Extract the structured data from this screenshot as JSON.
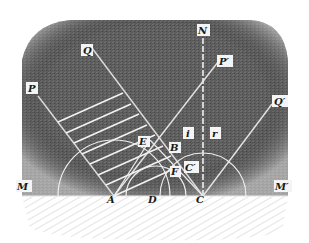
{
  "diagram": {
    "colors": {
      "medium": "#5a5a5a",
      "medium_dark": "#3d3d3d",
      "surface_hatch": "#bdbdbd",
      "lines": "#ececec",
      "background": "#ffffff"
    },
    "labels": {
      "P": "P",
      "Q": "Q",
      "N": "N",
      "P_prime": "P′",
      "Q_prime": "Q′",
      "M": "M",
      "M_prime": "M′",
      "A": "A",
      "D": "D",
      "C": "C",
      "E": "E",
      "B": "B",
      "F": "F",
      "C_prime": "C′",
      "i": "i",
      "r": "r"
    }
  }
}
